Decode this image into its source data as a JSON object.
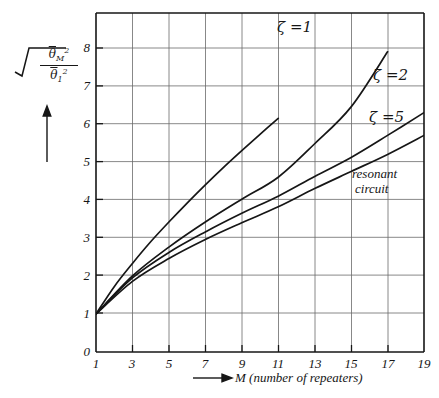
{
  "figure": {
    "kind": "line-chart",
    "background": "#ffffff",
    "ink_color": "#161616",
    "grid_color": "#555555"
  },
  "axes": {
    "y_label": {
      "root_symbol": "√",
      "numerator": "θ̄²M",
      "numerator_base": "θ",
      "numerator_sup": "2",
      "numerator_sub": "M",
      "denominator_base": "θ",
      "denominator_sup": "2",
      "denominator_sub": "1",
      "arrow": "↑"
    },
    "x_caption": "M (number of repeaters)",
    "x_caption_arrow": "⟶",
    "y_ticks": [
      "0",
      "1",
      "2",
      "3",
      "4",
      "5",
      "6",
      "7",
      "8"
    ],
    "y_tick_values": [
      0,
      1,
      2,
      3,
      4,
      5,
      6,
      7,
      8
    ],
    "x_ticks": [
      "1",
      "3",
      "5",
      "7",
      "9",
      "11",
      "13",
      "15",
      "17",
      "19"
    ],
    "x_tick_values": [
      1,
      3,
      5,
      7,
      9,
      11,
      13,
      15,
      17,
      19
    ]
  },
  "annotations": {
    "zeta1": "ζ =1",
    "zeta2": "ζ =2",
    "zeta5": "ζ =5",
    "resonant_line1": "resonant",
    "resonant_line2": "circuit"
  },
  "chart_data": {
    "type": "line",
    "title": "",
    "subtitle": "",
    "xlabel": "M (number of repeaters)",
    "ylabel": "sqrt( mean theta_M^2 / mean theta_1^2 )",
    "xlim": [
      1,
      19
    ],
    "ylim": [
      0,
      8.6
    ],
    "grid": true,
    "grid_x_step": 2,
    "grid_y_step": 1,
    "legend": "inline-curve-labels",
    "legend_position": "on-curves",
    "x": [
      1,
      3,
      5,
      7,
      9,
      11,
      13,
      15,
      17,
      19
    ],
    "series": [
      {
        "name": "ζ =1",
        "label": "zeta = 1",
        "x": [
          1,
          2,
          3,
          4,
          5,
          6,
          7,
          8,
          9,
          10,
          11
        ],
        "values": [
          1.0,
          1.72,
          2.33,
          2.9,
          3.42,
          3.92,
          4.4,
          4.86,
          5.3,
          5.73,
          6.15
        ],
        "note": "steepest curve, exits top of frame near M=11"
      },
      {
        "name": "ζ =2",
        "label": "zeta = 2",
        "x": [
          1,
          3,
          5,
          7,
          9,
          11,
          13,
          15,
          17
        ],
        "values": [
          1.0,
          2.0,
          2.76,
          3.42,
          4.02,
          4.6,
          5.48,
          6.45,
          7.9
        ],
        "note": "ends at M=17 near 7.9"
      },
      {
        "name": "ζ =5",
        "label": "zeta = 5",
        "x": [
          1,
          3,
          5,
          7,
          9,
          11,
          13,
          15,
          17,
          19
        ],
        "values": [
          1.0,
          1.95,
          2.62,
          3.16,
          3.65,
          4.1,
          4.62,
          5.12,
          5.7,
          6.3
        ],
        "note": "ends at right frame edge near 6.3"
      },
      {
        "name": "resonant circuit",
        "label": "resonant circuit",
        "x": [
          1,
          3,
          5,
          7,
          9,
          11,
          13,
          15,
          17,
          19
        ],
        "values": [
          1.0,
          1.86,
          2.46,
          2.96,
          3.4,
          3.82,
          4.3,
          4.75,
          5.2,
          5.7
        ],
        "note": "lowest curve, ends at right frame edge near 5.7"
      }
    ]
  }
}
